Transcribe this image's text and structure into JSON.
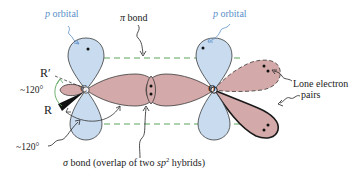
{
  "diagram": {
    "labels": {
      "p_orbital_left": {
        "italic": "p",
        "text": " orbital"
      },
      "p_orbital_right": {
        "italic": "p",
        "text": " orbital"
      },
      "pi_bond": {
        "symbol": "π",
        "text": " bond"
      },
      "r_prime": "R′",
      "r": "R",
      "angle_top": "~120°",
      "angle_bottom": "~120°",
      "carbon": "C",
      "oxygen": "O",
      "lone_pairs_line1": "Lone electron",
      "lone_pairs_line2": "pairs",
      "sigma_bond": {
        "symbol": "σ",
        "text_before": " bond (overlap of two ",
        "hybrid_italic": "sp",
        "hybrid_sup": "2",
        "text_after": " hybrids)"
      }
    },
    "colors": {
      "p_orbital_fill": "#c9dcef",
      "hybrid_fill": "#d4a9a9",
      "outline": "#3a3a3a",
      "pi_dash": "#5aa55a",
      "label_blue": "#5b8fc9",
      "angle_arc": "#5aa55a",
      "electron": "#111111"
    }
  }
}
